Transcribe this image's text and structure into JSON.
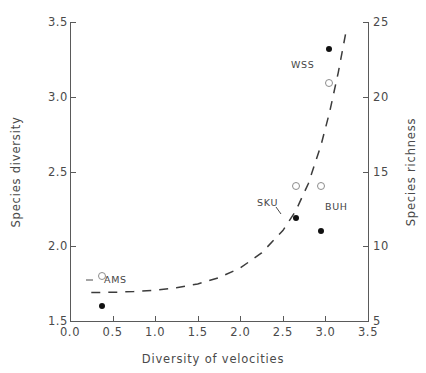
{
  "chart_data": {
    "type": "scatter",
    "title": "",
    "xlabel": "Diversity of velocities",
    "ylabel": "Species diversity",
    "ylabel_right": "Species richness",
    "xlim": [
      0.0,
      3.5
    ],
    "ylim": [
      1.5,
      3.5
    ],
    "ylim_right": [
      5,
      25
    ],
    "grid": false,
    "legend_position": "none",
    "xticks": [
      "0.0",
      "0.5",
      "1.0",
      "1.5",
      "2.0",
      "2.5",
      "3.0",
      "3.5"
    ],
    "xtick_values": [
      0.0,
      0.5,
      1.0,
      1.5,
      2.0,
      2.5,
      3.0,
      3.5
    ],
    "yticks_left": [
      "1.5",
      "2.0",
      "2.5",
      "3.0",
      "3.5"
    ],
    "ytick_values_left": [
      1.5,
      2.0,
      2.5,
      3.0,
      3.5
    ],
    "yticks_right": [
      "5",
      "10",
      "15",
      "20",
      "25"
    ],
    "ytick_values_right": [
      5,
      10,
      15,
      20,
      25
    ],
    "series": [
      {
        "name": "Species diversity",
        "marker": "filled-circle",
        "axis": "left",
        "color": "#111111",
        "points": [
          {
            "label": "AMS",
            "x": 0.37,
            "y": 1.6
          },
          {
            "label": "SKU",
            "x": 2.66,
            "y": 2.19
          },
          {
            "label": "BUH",
            "x": 2.95,
            "y": 2.1
          },
          {
            "label": "WSS",
            "x": 3.04,
            "y": 3.32
          }
        ]
      },
      {
        "name": "Species richness",
        "marker": "open-circle",
        "axis": "right",
        "color": "#8d8d8d",
        "points": [
          {
            "label": "AMS",
            "x": 0.37,
            "y": 8.0
          },
          {
            "label": "SKU",
            "x": 2.66,
            "y": 14.0
          },
          {
            "label": "BUH",
            "x": 2.95,
            "y": 14.0
          },
          {
            "label": "WSS",
            "x": 3.04,
            "y": 20.9
          }
        ]
      }
    ],
    "fit_curve": {
      "name": "fitted-trend",
      "style": "dashed",
      "axis": "left",
      "x": [
        0.25,
        0.5,
        0.75,
        1.0,
        1.25,
        1.5,
        1.75,
        2.0,
        2.25,
        2.5,
        2.65,
        2.8,
        2.95,
        3.05,
        3.15,
        3.25
      ],
      "y": [
        1.69,
        1.692,
        1.697,
        1.706,
        1.722,
        1.748,
        1.79,
        1.855,
        1.955,
        2.105,
        2.235,
        2.42,
        2.68,
        2.9,
        3.16,
        3.46
      ]
    },
    "annotations": [
      {
        "text": "AMS",
        "x": 0.5,
        "y": 1.69
      },
      {
        "text": "SKU",
        "x": 2.4,
        "y": 2.28
      },
      {
        "text": "BUH",
        "x": 3.05,
        "y": 2.24
      },
      {
        "text": "WSS",
        "x": 2.7,
        "y": 3.15
      }
    ]
  },
  "axes": {
    "x_title": "Diversity of velocities",
    "y_left_title": "Species diversity",
    "y_right_title": "Species richness",
    "x_ticks": [
      "0.0",
      "0.5",
      "1.0",
      "1.5",
      "2.0",
      "2.5",
      "3.0",
      "3.5"
    ],
    "y_left_ticks": [
      "1.5",
      "2.0",
      "2.5",
      "3.0",
      "3.5"
    ],
    "y_right_ticks": [
      "5",
      "10",
      "15",
      "20",
      "25"
    ]
  },
  "site_labels": {
    "ams": "AMS",
    "sku": "SKU",
    "buh": "BUH",
    "wss": "WSS"
  }
}
